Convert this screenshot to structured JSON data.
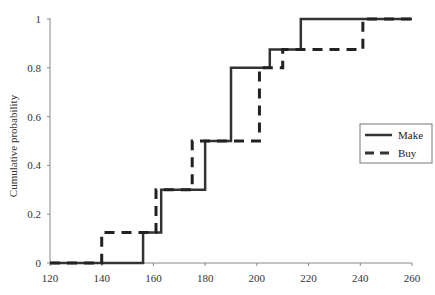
{
  "chart_data": {
    "type": "line",
    "subtype": "step-cdf",
    "title": "",
    "xlabel": "",
    "ylabel": "Cumulative probability",
    "xlim": [
      120,
      260
    ],
    "ylim": [
      0,
      1
    ],
    "x_ticks": [
      120,
      140,
      160,
      180,
      200,
      220,
      240,
      260
    ],
    "y_ticks": [
      0,
      0.2,
      0.4,
      0.6,
      0.8,
      1
    ],
    "x_tick_labels": [
      "120",
      "140",
      "160",
      "180",
      "200",
      "220",
      "240",
      "260"
    ],
    "y_tick_labels": [
      "0",
      "0.2",
      "0.4",
      "0.6",
      "0.8",
      "1"
    ],
    "grid": false,
    "legend_position": "right",
    "series": [
      {
        "name": "Make",
        "style": "solid",
        "color": "#333333",
        "steps": [
          {
            "x": 120,
            "y": 0
          },
          {
            "x": 156,
            "y": 0.125
          },
          {
            "x": 163,
            "y": 0.3
          },
          {
            "x": 180,
            "y": 0.5
          },
          {
            "x": 190,
            "y": 0.8
          },
          {
            "x": 205,
            "y": 0.875
          },
          {
            "x": 217,
            "y": 1.0
          }
        ],
        "end_x": 260
      },
      {
        "name": "Buy",
        "style": "dashed",
        "color": "#222222",
        "steps": [
          {
            "x": 120,
            "y": 0
          },
          {
            "x": 140,
            "y": 0.125
          },
          {
            "x": 161,
            "y": 0.3
          },
          {
            "x": 175,
            "y": 0.5
          },
          {
            "x": 201,
            "y": 0.8
          },
          {
            "x": 210,
            "y": 0.875
          },
          {
            "x": 241,
            "y": 1.0
          }
        ],
        "end_x": 260
      }
    ]
  },
  "legend": {
    "items": [
      {
        "label": "Make",
        "style": "solid"
      },
      {
        "label": "Buy",
        "style": "dashed"
      }
    ]
  },
  "axes": {
    "ylabel": "Cumulative probability"
  }
}
